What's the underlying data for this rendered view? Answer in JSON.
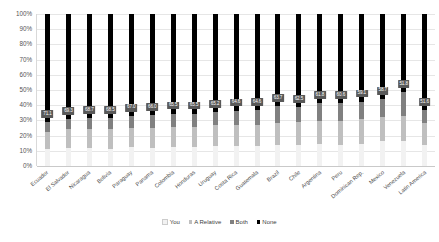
{
  "chart_data": {
    "type": "bar",
    "subtype": "100% stacked column",
    "title": "",
    "xlabel": "",
    "ylabel": "",
    "ylim": [
      0,
      100
    ],
    "ytick_labels": [
      "100%",
      "90%",
      "80%",
      "70%",
      "60%",
      "50%",
      "40%",
      "30%",
      "20%",
      "10%",
      "0%"
    ],
    "ytick_values": [
      100,
      90,
      80,
      70,
      60,
      50,
      40,
      30,
      20,
      10,
      0
    ],
    "grid": true,
    "legend_position": "bottom",
    "legend": [
      "You",
      "A Relative",
      "Both",
      "None"
    ],
    "data_labels_series": "None",
    "categories": [
      "Ecuador",
      "El Salvador",
      "Nicaragua",
      "Bolivia",
      "Paraguay",
      "Panama",
      "Colombia",
      "Honduras",
      "Uruguay",
      "Costa Rica",
      "Guatemala",
      "Brazil",
      "Chile",
      "Argentina",
      "Peru",
      "Dominican Rep.",
      "Mexico",
      "Venezuela",
      "Latin America"
    ],
    "series": [
      {
        "name": "You",
        "color": "#f2f2f2",
        "values": [
          11.2,
          11.9,
          12.0,
          11.5,
          12.3,
          11.8,
          12.4,
          12.6,
          13.1,
          13.0,
          13.4,
          13.9,
          14.2,
          14.6,
          14.0,
          14.8,
          16.2,
          16.5,
          13.5
        ]
      },
      {
        "name": "A Relative",
        "color": "#bfbfbf",
        "values": [
          11.3,
          12.2,
          12.1,
          12.7,
          13.0,
          12.9,
          13.3,
          13.4,
          13.8,
          14.0,
          14.3,
          14.7,
          15.0,
          15.3,
          15.5,
          15.9,
          16.3,
          16.6,
          14.6
        ]
      },
      {
        "name": "Both",
        "color": "#808080",
        "values": [
          6.4,
          6.6,
          7.2,
          7.3,
          7.7,
          8.3,
          8.8,
          8.5,
          8.6,
          9.5,
          9.7,
          10.9,
          10.2,
          11.6,
          11.8,
          11.6,
          11.7,
          15.3,
          8.6
        ]
      },
      {
        "name": "None",
        "color": "#000000",
        "values": [
          71.1,
          69.3,
          68.7,
          68.5,
          67.0,
          66.0,
          65.5,
          65.5,
          64.5,
          63.5,
          64.6,
          60.5,
          62.5,
          58.5,
          58.7,
          57.7,
          55.8,
          51.6,
          63.3
        ]
      }
    ],
    "data_labels": [
      "71.1",
      "69.3",
      "68.7",
      "68.5",
      "67.0",
      "66.0",
      "65.5",
      "65.5",
      "65.2",
      "64.6",
      "64.6",
      "63.7",
      "62.5",
      "61.8",
      "60.6",
      "59.1",
      "58.7",
      "51.8",
      "51.6",
      "63.3"
    ],
    "bar_labels": [
      "71.1",
      "69.3",
      "68.7",
      "68.5",
      "67.0",
      "66.0",
      "65.5",
      "65.5",
      "65.2",
      "64.6",
      "64.6",
      "63.7",
      "62.5",
      "61.8",
      "60.6",
      "59.1",
      "58.7",
      "51.8",
      "51.6"
    ]
  },
  "colors": {
    "you": "#f2f2f2",
    "a_relative": "#bfbfbf",
    "both": "#808080",
    "none": "#000000",
    "label_bg": "#595959",
    "grid": "#e6e6e6",
    "text": "#4a4a4a",
    "background": "#ffffff"
  }
}
